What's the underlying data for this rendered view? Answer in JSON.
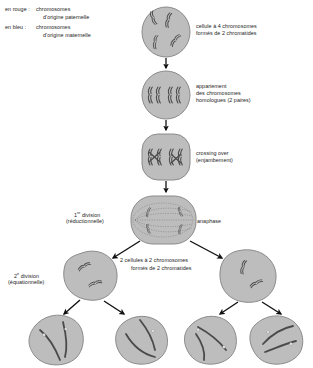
{
  "diagram": {
    "bg_color": "#ffffff",
    "cell_fill": "#bdbdbd",
    "cell_stroke": "#8a8a8a",
    "chromosome_color": "#4a4a4a",
    "arrow_color": "#111111"
  },
  "legend": {
    "items": [
      {
        "key": "en rouge :",
        "line1": "chromosomes",
        "line2": "d'origine paternelle"
      },
      {
        "key": "en bleu :",
        "line1": "chromosomes",
        "line2": "d'origine maternelle"
      }
    ]
  },
  "stages": [
    {
      "id": "stage-1",
      "caption_line1": "cellule à 4 chromosomes",
      "caption_line2": "formés de 2 chromatides",
      "chromosome_count": 4,
      "chromatids_per_chromosome": 2
    },
    {
      "id": "stage-2",
      "caption_line1": "appariement",
      "caption_line2": "des chromosomes",
      "caption_line3": "homologues (2 paires)",
      "pairs": 2
    },
    {
      "id": "stage-3",
      "caption_line1": "crossing over",
      "caption_line2": "(enjambement)"
    },
    {
      "id": "stage-4",
      "caption_left_line1": "1",
      "caption_left_sup": "re",
      "caption_left_line1b": " division",
      "caption_left_line2": "(réductionnelle)",
      "caption_right": "anaphase"
    }
  ],
  "labels": {
    "middle_line1": "2 cellules à 2 chromosomes",
    "middle_line2": "formés de 2 chromatides",
    "second_division_num": "2",
    "second_division_sup": "e",
    "second_division_word": " division",
    "second_division_line2": "(équationnelle)"
  },
  "gametes": {
    "count": 4,
    "chromosomes_each": 2
  }
}
